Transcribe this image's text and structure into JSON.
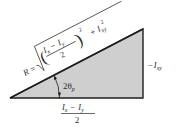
{
  "diagram": {
    "type": "right-triangle",
    "colors": {
      "fill": "#cfcfcf",
      "stroke": "#1f1f1f",
      "text": "#2a2a2a",
      "background": "#ffffff"
    },
    "hypotenuse_label": {
      "lhs": "R =",
      "numerator": "I",
      "num_sub_1": "x",
      "minus": "−",
      "num_sub_2": "y",
      "denominator": "2",
      "exponent": "2",
      "plus": "+",
      "term": "I",
      "term_sub": "xy",
      "term_exp": "2"
    },
    "angle_label": {
      "coef": "2θ",
      "sub": "p"
    },
    "vertical_side_label": {
      "sign": "−",
      "var": "I",
      "sub": "xy"
    },
    "horizontal_side_label": {
      "var1": "I",
      "sub1": "x",
      "minus": "−",
      "var2": "I",
      "sub2": "y",
      "denominator": "2"
    }
  }
}
